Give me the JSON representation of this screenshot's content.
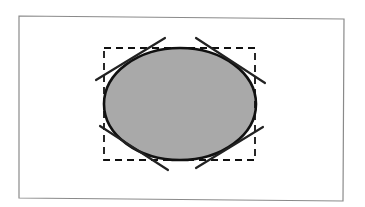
{
  "diagram": {
    "type": "ellipse-with-bounding-box-and-tangents",
    "canvas": {
      "width": 365,
      "height": 207,
      "background": "#ffffff"
    },
    "frame": {
      "points": [
        [
          19,
          16
        ],
        [
          344,
          19
        ],
        [
          343,
          201
        ],
        [
          19,
          198
        ]
      ],
      "stroke": "#8a8a8a",
      "stroke_width": 1.2
    },
    "ellipse": {
      "cx": 180,
      "cy": 104,
      "rx": 76,
      "ry": 56,
      "fill": "#a9a9a9",
      "stroke": "#111111",
      "stroke_width": 2.6
    },
    "bounding_box": {
      "x": 104,
      "y": 48,
      "width": 151,
      "height": 112,
      "stroke": "#111111",
      "stroke_width": 1.8,
      "dash": "7,5"
    },
    "tangent_lines": [
      {
        "id": "top-left",
        "x1": 96,
        "y1": 80,
        "x2": 165,
        "y2": 38
      },
      {
        "id": "top-right",
        "x1": 196,
        "y1": 38,
        "x2": 265,
        "y2": 83
      },
      {
        "id": "bottom-left",
        "x1": 100,
        "y1": 126,
        "x2": 168,
        "y2": 170
      },
      {
        "id": "bottom-right",
        "x1": 196,
        "y1": 168,
        "x2": 263,
        "y2": 127
      }
    ],
    "tangent_style": {
      "stroke": "#222222",
      "stroke_width": 2.2
    }
  }
}
